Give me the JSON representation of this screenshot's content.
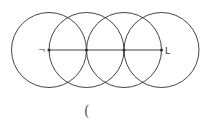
{
  "diagram": {
    "circles": [
      {
        "cx": 49,
        "cy": 50,
        "r": 37.5
      },
      {
        "cx": 86.5,
        "cy": 50,
        "r": 37.5
      },
      {
        "cx": 124,
        "cy": 50,
        "r": 37.5
      },
      {
        "cx": 161.5,
        "cy": 50,
        "r": 37.5
      }
    ],
    "segment": {
      "x1": 49,
      "y1": 50,
      "x2": 161.5,
      "y2": 50
    },
    "points": [
      {
        "x": 49,
        "y": 50
      },
      {
        "x": 86.5,
        "y": 50
      },
      {
        "x": 124,
        "y": 50
      },
      {
        "x": 161.5,
        "y": 50
      }
    ],
    "labels": {
      "left": "¬",
      "right": "L"
    },
    "caption": "("
  }
}
